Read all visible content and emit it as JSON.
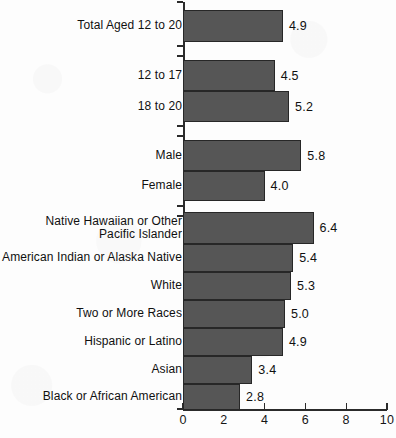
{
  "chart_data": {
    "type": "bar",
    "orientation": "horizontal",
    "title": "",
    "subtitle": "",
    "xlabel": "",
    "ylabel": "",
    "xlim": [
      0,
      10
    ],
    "xticks": [
      0,
      2,
      4,
      6,
      8,
      10
    ],
    "xtick_labels": [
      "0",
      "2",
      "4",
      "6",
      "8",
      "10"
    ],
    "grid": false,
    "legend": null,
    "bar_color": "#565656",
    "bar_edge_color": "#272727",
    "axis_color": "#2b2b2b",
    "background_color": "#ffffff",
    "categories": [
      "Total Aged 12 to 20",
      "12 to 17",
      "18 to 20",
      "Male",
      "Female",
      "Native Hawaiian or Other\nPacific Islander",
      "American Indian or Alaska Native",
      "White",
      "Two or More Races",
      "Hispanic or Latino",
      "Asian",
      "Black or African American"
    ],
    "values": [
      4.9,
      4.5,
      5.2,
      5.8,
      4.0,
      6.4,
      5.4,
      5.3,
      5.0,
      4.9,
      3.4,
      2.8
    ],
    "value_labels": [
      "4.9",
      "4.5",
      "5.2",
      "5.8",
      "4.0",
      "6.4",
      "5.4",
      "5.3",
      "5.0",
      "4.9",
      "3.4",
      "2.8"
    ],
    "groups": [
      {
        "name": "total",
        "categories": [
          "Total Aged 12 to 20"
        ]
      },
      {
        "name": "age",
        "categories": [
          "12 to 17",
          "18 to 20"
        ]
      },
      {
        "name": "gender",
        "categories": [
          "Male",
          "Female"
        ]
      },
      {
        "name": "race",
        "categories": [
          "Native Hawaiian or Other Pacific Islander",
          "American Indian or Alaska Native",
          "White",
          "Two or More Races",
          "Hispanic or Latino",
          "Asian",
          "Black or African American"
        ]
      }
    ]
  },
  "bars": [
    {
      "label": "Total Aged 12 to 20",
      "value": 4.9,
      "value_label": "4.9",
      "top": 10,
      "height": 32
    },
    {
      "label": "12 to 17",
      "value": 4.5,
      "value_label": "4.5",
      "top": 60,
      "height": 31
    },
    {
      "label": "18 to 20",
      "value": 5.2,
      "value_label": "5.2",
      "top": 91,
      "height": 31
    },
    {
      "label": "Male",
      "value": 5.8,
      "value_label": "5.8",
      "top": 140,
      "height": 31
    },
    {
      "label": "Female",
      "value": 4.0,
      "value_label": "4.0",
      "top": 171,
      "height": 30
    },
    {
      "label": "Native Hawaiian or Other\nPacific Islander",
      "value": 6.4,
      "value_label": "6.4",
      "top": 212,
      "height": 32
    },
    {
      "label": "American Indian or Alaska Native",
      "value": 5.4,
      "value_label": "5.4",
      "top": 244,
      "height": 28
    },
    {
      "label": "White",
      "value": 5.3,
      "value_label": "5.3",
      "top": 272,
      "height": 28
    },
    {
      "label": "Two or More Races",
      "value": 5.0,
      "value_label": "5.0",
      "top": 300,
      "height": 28
    },
    {
      "label": "Hispanic or Latino",
      "value": 4.9,
      "value_label": "4.9",
      "top": 328,
      "height": 28
    },
    {
      "label": "Asian",
      "value": 3.4,
      "value_label": "3.4",
      "top": 356,
      "height": 28
    },
    {
      "label": "Black or African American",
      "value": 2.8,
      "value_label": "2.8",
      "top": 384,
      "height": 26
    }
  ],
  "y_group_ticks": [
    2,
    46,
    56,
    126,
    136,
    206,
    216,
    409
  ],
  "axis": {
    "x_origin_px": 183,
    "px_per_unit": 20.4,
    "top_px": 2,
    "baseline_px": 409,
    "length_px": 204
  }
}
